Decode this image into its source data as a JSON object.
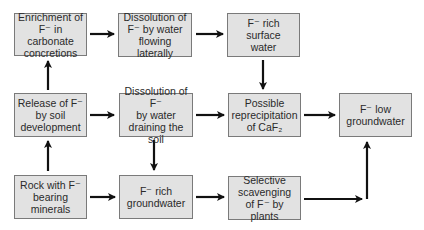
{
  "diagram": {
    "type": "flowchart",
    "nodes": [
      {
        "id": "enrichment",
        "label": "Enrichment of\nF⁻ in carbonate\nconcretions"
      },
      {
        "id": "dissolution_lateral",
        "label": "Dissolution of\nF⁻ by water\nflowing laterally"
      },
      {
        "id": "surface_water",
        "label": "F⁻ rich surface\nwater"
      },
      {
        "id": "release",
        "label": "Release of F⁻\nby soil\ndevelopment"
      },
      {
        "id": "dissolution_draining",
        "label": "Dissolution of F⁻\nby water\ndraining the soil"
      },
      {
        "id": "reprecipitation",
        "label": "Possible\nreprecipitation\nof CaF₂"
      },
      {
        "id": "low_groundwater",
        "label": "F⁻ low\ngroundwater"
      },
      {
        "id": "rock",
        "label": "Rock with F⁻\nbearing\nminerals"
      },
      {
        "id": "rich_groundwater",
        "label": "F⁻ rich\ngroundwater"
      },
      {
        "id": "scavenging",
        "label": "Selective\nscavenging\nof F⁻ by plants"
      }
    ],
    "edges": [
      {
        "from": "rock",
        "to": "release"
      },
      {
        "from": "rock",
        "to": "rich_groundwater"
      },
      {
        "from": "release",
        "to": "enrichment"
      },
      {
        "from": "release",
        "to": "dissolution_draining"
      },
      {
        "from": "enrichment",
        "to": "dissolution_lateral"
      },
      {
        "from": "dissolution_lateral",
        "to": "surface_water"
      },
      {
        "from": "dissolution_draining",
        "to": "reprecipitation"
      },
      {
        "from": "dissolution_draining",
        "to": "rich_groundwater"
      },
      {
        "from": "surface_water",
        "to": "reprecipitation"
      },
      {
        "from": "reprecipitation",
        "to": "low_groundwater"
      },
      {
        "from": "rich_groundwater",
        "to": "scavenging"
      },
      {
        "from": "scavenging",
        "to": "low_groundwater"
      }
    ],
    "colors": {
      "box_fill": "#e2e2e2",
      "box_border": "#7a7a7a",
      "arrow": "#111111",
      "text": "#2a2a2a"
    }
  }
}
